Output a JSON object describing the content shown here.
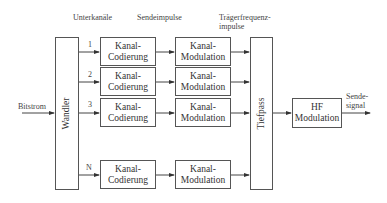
{
  "headers": {
    "subchannels": "Unterkanäle",
    "send_pulses": "Sendeimpulse",
    "carrier_pulses_line1": "Trägerfrequenz-",
    "carrier_pulses_line2": "impulse"
  },
  "input": {
    "label": "Bitstrom"
  },
  "output": {
    "label_line1": "Sende-",
    "label_line2": "signal"
  },
  "converter": {
    "label": "Wandler"
  },
  "lowpass": {
    "label": "Tiefpass"
  },
  "hf_modulation": {
    "line1": "HF",
    "line2": "Modulation"
  },
  "channels": [
    {
      "number": "1",
      "coding_line1": "Kanal-",
      "coding_line2": "Codierung",
      "mod_line1": "Kanal-",
      "mod_line2": "Modulation"
    },
    {
      "number": "2",
      "coding_line1": "Kanal-",
      "coding_line2": "Codierung",
      "mod_line1": "Kanal-",
      "mod_line2": "Modulation"
    },
    {
      "number": "3",
      "coding_line1": "Kanal-",
      "coding_line2": "Codierung",
      "mod_line1": "Kanal-",
      "mod_line2": "Modulation"
    },
    {
      "number": "N",
      "coding_line1": "Kanal-",
      "coding_line2": "Codierung",
      "mod_line1": "Kanal-",
      "mod_line2": "Modulation"
    }
  ]
}
